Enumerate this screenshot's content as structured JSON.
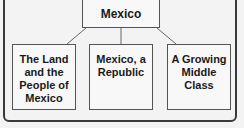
{
  "diagram": {
    "root": {
      "label": "Mexico"
    },
    "children": [
      {
        "label": "The Land and the People of Mexico"
      },
      {
        "label": "Mexico, a Republic"
      },
      {
        "label": "A Growing Middle Class"
      }
    ],
    "colors": {
      "border": "#3a3a3a",
      "background": "#f3f3f3",
      "text": "#1a1a1a"
    }
  }
}
